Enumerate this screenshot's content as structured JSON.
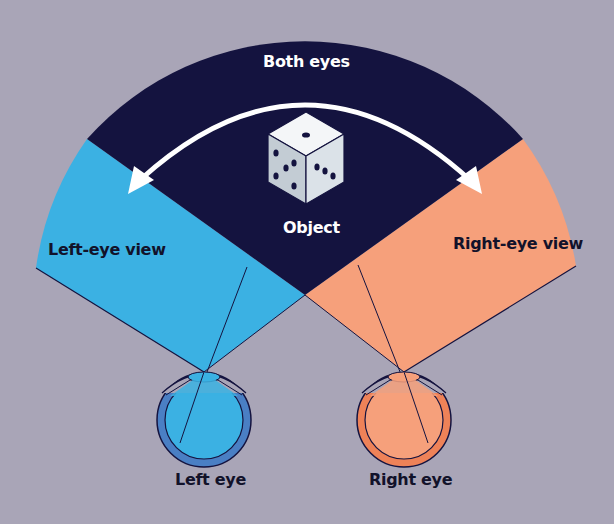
{
  "labels": {
    "both_eyes": "Both eyes",
    "object": "Object",
    "left_view": "Left-eye view",
    "right_view": "Right-eye view",
    "left_eye": "Left eye",
    "right_eye": "Right eye"
  },
  "colors": {
    "background": "#a9a5b7",
    "both_eyes_region": "#14133f",
    "left_view_region": "#3bb1e3",
    "right_view_region": "#f6a07b",
    "left_eye_sclera": "#4a7fc4",
    "right_eye_sclera": "#ee8258",
    "outline": "#14133f",
    "arrow": "#ffffff"
  },
  "icons": {
    "object": "dice-icon",
    "arrow": "double-headed-curved-arrow-icon",
    "left_eye": "eyeball-icon",
    "right_eye": "eyeball-icon"
  }
}
